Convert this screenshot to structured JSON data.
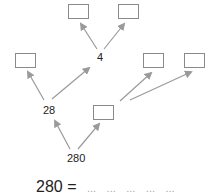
{
  "diagram": {
    "type": "factor-tree",
    "root": "280",
    "nodes": [
      {
        "id": "root",
        "label": "280"
      },
      {
        "id": "n28",
        "label": "28"
      },
      {
        "id": "boxMid",
        "label": ""
      },
      {
        "id": "boxLeft",
        "label": ""
      },
      {
        "id": "n4",
        "label": "4"
      },
      {
        "id": "boxTopL",
        "label": ""
      },
      {
        "id": "boxTopR",
        "label": ""
      },
      {
        "id": "boxRightA",
        "label": ""
      },
      {
        "id": "boxRightB",
        "label": ""
      }
    ],
    "edges": [
      [
        "root",
        "n28"
      ],
      [
        "root",
        "boxMid"
      ],
      [
        "n28",
        "boxLeft"
      ],
      [
        "n28",
        "n4"
      ],
      [
        "n4",
        "boxTopL"
      ],
      [
        "n4",
        "boxTopR"
      ],
      [
        "boxMid",
        "boxRightA"
      ],
      [
        "boxMid",
        "boxRightB"
      ]
    ]
  },
  "labels": {
    "root": "280",
    "n28": "28",
    "n4": "4"
  },
  "equation": {
    "lhs": "280",
    "equals": "=",
    "blanks": [
      "...",
      "...",
      "...",
      "...",
      "..."
    ]
  },
  "colors": {
    "arrow": "#9a9a9a",
    "box_border": "#8a8a8a",
    "text": "#222222",
    "blank_dots": "#aaaaaa"
  }
}
